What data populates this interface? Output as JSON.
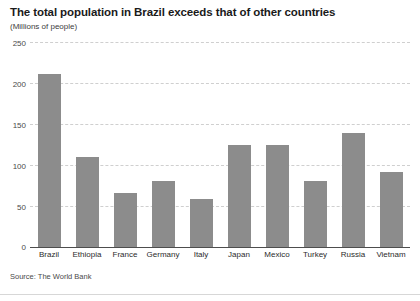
{
  "chart_data": {
    "type": "bar",
    "title": "The total population in Brazil exceeds that of other countries",
    "subtitle": "(Millions of people)",
    "xlabel": "",
    "ylabel": "",
    "ylim": [
      0,
      250
    ],
    "yticks": [
      0,
      50,
      100,
      150,
      200,
      250
    ],
    "ytick_labels": [
      "0",
      "50",
      "100",
      "150",
      "200",
      "250"
    ],
    "grid": true,
    "legend": "none",
    "bar_color": "#8c8c8c",
    "categories": [
      "Brazil",
      "Ethiopia",
      "France",
      "Germany",
      "Italy",
      "Japan",
      "Mexico",
      "Turkey",
      "Russia",
      "Vietnam"
    ],
    "values": [
      211,
      110,
      66,
      81,
      59,
      124,
      124,
      80,
      139,
      91
    ],
    "source": "Source: The World Bank"
  }
}
